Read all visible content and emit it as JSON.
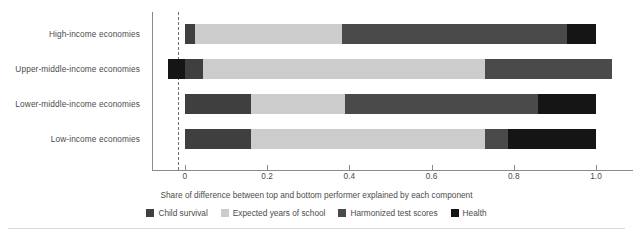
{
  "chart_data": {
    "type": "bar",
    "orientation": "horizontal",
    "stacked": true,
    "title": "",
    "xlabel": "Share of difference between top and bottom performer explained by each component",
    "ylabel": "",
    "xlim": [
      -0.08,
      1.09
    ],
    "xticks": [
      0,
      0.2,
      0.4,
      0.6,
      0.8,
      1.0
    ],
    "xticklabels": [
      "0",
      "0.2",
      "0.4",
      "0.6",
      "0.8",
      "1.0"
    ],
    "grid": false,
    "zero_reference_line": 0,
    "legend_position": "bottom",
    "categories": [
      "High-income economies",
      "Upper-middle-income economies",
      "Lower-middle-income economies",
      "Low-income economies"
    ],
    "series": [
      {
        "name": "Child survival",
        "color": "#3f3f3f",
        "values": [
          0.025,
          0.045,
          0.16,
          0.16
        ]
      },
      {
        "name": "Expected years of school",
        "color": "#cccccc",
        "values": [
          0.358,
          0.685,
          0.23,
          0.56
        ]
      },
      {
        "name": "Harmonized test scores",
        "color": "#4a4a4a",
        "values": [
          0.547,
          0.31,
          0.47,
          0.055
        ]
      },
      {
        "name": "Health",
        "color": "#151515",
        "values": [
          0.07,
          -0.04,
          0.14,
          0.225
        ]
      }
    ],
    "totals": [
      1.0,
      1.0,
      0.96,
      1.0
    ]
  },
  "axis": {
    "xtitle": "Share of difference between top and bottom performer explained by each component",
    "ticklabels": [
      "0",
      "0.2",
      "0.4",
      "0.6",
      "0.8",
      "1.0"
    ],
    "ylabels": [
      "High-income economies",
      "Upper-middle-income economies",
      "Lower-middle-income economies",
      "Low-income economies"
    ]
  },
  "legend": {
    "items": [
      {
        "label": "Child survival",
        "color": "#3f3f3f"
      },
      {
        "label": "Expected years of school",
        "color": "#cccccc"
      },
      {
        "label": "Harmonized test scores",
        "color": "#4a4a4a"
      },
      {
        "label": "Health",
        "color": "#151515"
      }
    ]
  },
  "colors": {
    "axis": "#8a8a8a",
    "text": "#4c4c4c",
    "zero_line": "#6f6f6f",
    "background": "#ffffff",
    "rule": "#d8d8d8"
  },
  "bars_layout": {
    "segments": [
      [
        {
          "series": 0,
          "start": 0.0,
          "end": 0.025
        },
        {
          "series": 1,
          "start": 0.025,
          "end": 0.383
        },
        {
          "series": 2,
          "start": 0.383,
          "end": 0.93
        },
        {
          "series": 3,
          "start": 0.93,
          "end": 1.0
        }
      ],
      [
        {
          "series": 3,
          "start": -0.04,
          "end": 0.0
        },
        {
          "series": 0,
          "start": 0.0,
          "end": 0.045
        },
        {
          "series": 1,
          "start": 0.045,
          "end": 0.73
        },
        {
          "series": 2,
          "start": 0.73,
          "end": 1.04
        }
      ],
      [
        {
          "series": 0,
          "start": 0.0,
          "end": 0.16
        },
        {
          "series": 1,
          "start": 0.16,
          "end": 0.39
        },
        {
          "series": 2,
          "start": 0.39,
          "end": 0.86
        },
        {
          "series": 3,
          "start": 0.86,
          "end": 1.0
        }
      ],
      [
        {
          "series": 0,
          "start": 0.0,
          "end": 0.16
        },
        {
          "series": 1,
          "start": 0.16,
          "end": 0.73
        },
        {
          "series": 2,
          "start": 0.73,
          "end": 0.785
        },
        {
          "series": 3,
          "start": 0.785,
          "end": 1.0
        }
      ]
    ]
  }
}
